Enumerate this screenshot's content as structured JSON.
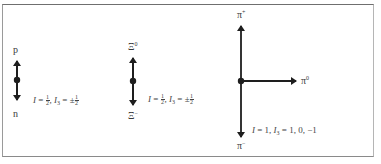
{
  "diagram": {
    "type": "isospin-multiplets",
    "colors": {
      "ink": "#1e1e1e",
      "frame": "#7a7a7a",
      "text": "#3a3a3a"
    },
    "multiplets": [
      {
        "name": "nucleon",
        "top_label": "p",
        "bottom_label": "n",
        "equation": {
          "I_sym": "I",
          "I_val_num": "1",
          "I_val_den": "2",
          "I3_sym": "I",
          "I3_sub": "3",
          "I3_prefix": "±",
          "I3_val_num": "1",
          "I3_val_den": "2",
          "eq": "=",
          "sep": ","
        }
      },
      {
        "name": "xi",
        "top_label": "Ξ",
        "top_charge": "0",
        "bottom_label": "Ξ",
        "bottom_charge": "−",
        "equation": {
          "I_sym": "I",
          "I_val_num": "1",
          "I_val_den": "2",
          "I3_sym": "I",
          "I3_sub": "3",
          "I3_prefix": "±",
          "I3_val_num": "1",
          "I3_val_den": "2",
          "eq": "=",
          "sep": ","
        }
      },
      {
        "name": "pion",
        "top_label": "π",
        "top_charge": "+",
        "right_label": "π",
        "right_charge": "0",
        "bottom_label": "π",
        "bottom_charge": "−",
        "equation": {
          "I_sym": "I",
          "I_val": "1",
          "I3_sym": "I",
          "I3_sub": "3",
          "I3_vals": "1, 0, −1",
          "eq": "=",
          "sep": ","
        }
      }
    ]
  }
}
